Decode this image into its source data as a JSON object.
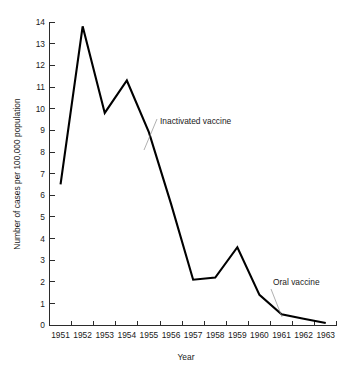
{
  "chart_data": {
    "type": "line",
    "title": "",
    "xlabel": "Year",
    "ylabel": "Number of cases per 100,000 population",
    "x": [
      1951,
      1952,
      1953,
      1954,
      1955,
      1956,
      1957,
      1958,
      1959,
      1960,
      1961,
      1962,
      1963
    ],
    "categories": [
      "1951",
      "1952",
      "1953",
      "1954",
      "1955",
      "1956",
      "1957",
      "1958",
      "1959",
      "1960",
      "1961",
      "1962",
      "1963"
    ],
    "values": [
      6.5,
      13.8,
      9.8,
      11.3,
      8.9,
      5.6,
      2.1,
      2.2,
      3.6,
      1.4,
      0.5,
      0.3,
      0.1
    ],
    "series": [
      {
        "name": "Poliomyelitis cases",
        "values": [
          6.5,
          13.8,
          9.8,
          11.3,
          8.9,
          5.6,
          2.1,
          2.2,
          3.6,
          1.4,
          0.5,
          0.3,
          0.1
        ]
      }
    ],
    "xlim": [
      1950.6,
      1963.6
    ],
    "ylim": [
      0,
      14
    ],
    "ytick_labels": [
      "0",
      "1",
      "2",
      "3",
      "4",
      "5",
      "6",
      "7",
      "8",
      "9",
      "10",
      "11",
      "12",
      "13",
      "14"
    ],
    "ytick_values": [
      0,
      1,
      2,
      3,
      4,
      5,
      6,
      7,
      8,
      9,
      10,
      11,
      12,
      13,
      14
    ],
    "xtick_labels": [
      "1951",
      "1952",
      "1953",
      "1954",
      "1955",
      "1956",
      "1957",
      "1958",
      "1959",
      "1960",
      "1961",
      "1962",
      "1963"
    ],
    "grid": false,
    "legend": "none",
    "line_color": "#000000",
    "annotations": [
      {
        "text": "Inactivated vaccine",
        "label_x": 160,
        "label_y": 124,
        "leader_from_x": 157,
        "leader_from_y": 119,
        "leader_to_x": 144,
        "leader_to_y": 150
      },
      {
        "text": "Oral vaccine",
        "label_x": 273,
        "label_y": 285,
        "leader_from_x": 271,
        "leader_from_y": 289,
        "leader_to_x": 282,
        "leader_to_y": 317
      }
    ]
  },
  "axes": {
    "x_axis_title": "Year",
    "y_axis_title": "Number of cases per 100,000 population"
  }
}
